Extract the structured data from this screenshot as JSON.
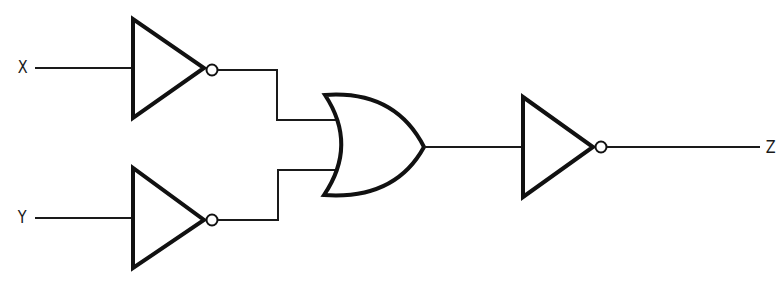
{
  "diagram": {
    "type": "logic-circuit",
    "inputs": [
      {
        "id": "x",
        "label": "X"
      },
      {
        "id": "y",
        "label": "Y"
      }
    ],
    "output": {
      "id": "z",
      "label": "Z"
    },
    "gates": [
      {
        "id": "not-x",
        "type": "NOT",
        "input": "X"
      },
      {
        "id": "not-y",
        "type": "NOT",
        "input": "Y"
      },
      {
        "id": "or",
        "type": "OR",
        "inputs": [
          "NOT X",
          "NOT Y"
        ]
      },
      {
        "id": "not-out",
        "type": "NOT",
        "input": "OR",
        "output": "Z"
      }
    ],
    "colors": {
      "line": "#111111",
      "background": "#ffffff"
    }
  }
}
